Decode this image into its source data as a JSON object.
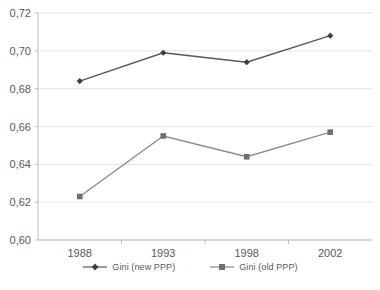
{
  "chart_data": {
    "type": "line",
    "title": "",
    "subtitle": "",
    "xlabel": "",
    "ylabel": "",
    "categories": [
      "1988",
      "1993",
      "1998",
      "2002"
    ],
    "x": [
      1988,
      1993,
      1998,
      2002
    ],
    "series": [
      {
        "name": "Gini (new PPP)",
        "values": [
          0.684,
          0.699,
          0.694,
          0.708
        ],
        "color": "#58585a",
        "marker": "diamond"
      },
      {
        "name": "Gini (old PPP)",
        "values": [
          0.623,
          0.655,
          0.644,
          0.657
        ],
        "color": "#8c8c8e",
        "marker": "square"
      }
    ],
    "ylim": [
      0.6,
      0.72
    ],
    "ytick_values": [
      0.72,
      0.7,
      0.68,
      0.66,
      0.64,
      0.62,
      0.6
    ],
    "ytick_labels": [
      "0,72",
      "0,70",
      "0,68",
      "0,66",
      "0,64",
      "0,62",
      "0,60"
    ],
    "xtick_labels": [
      "1988",
      "1993",
      "1998",
      "2002"
    ],
    "grid": "horizontal",
    "legend_position": "bottom",
    "decimal_separator": ",",
    "gridline_color": "#e3e3e3",
    "axis_color": "#bdbdbd",
    "text_color": "#5a5a5a",
    "background": "#ffffff"
  },
  "legend": {
    "entries": [
      {
        "label": "Gini (new PPP)"
      },
      {
        "label": "Gini (old PPP)"
      }
    ]
  },
  "axes": {
    "y_labels": [
      "0,72",
      "0,70",
      "0,68",
      "0,66",
      "0,64",
      "0,62",
      "0,60"
    ],
    "x_labels": [
      "1988",
      "1993",
      "1998",
      "2002"
    ]
  }
}
